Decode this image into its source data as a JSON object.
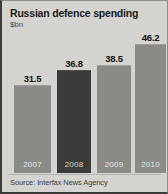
{
  "chart_data": {
    "type": "bar",
    "title": "Russian defence spending",
    "subtitle": "$bn",
    "xlabel": "",
    "ylabel": "$bn",
    "ylim": [
      0,
      46.2
    ],
    "grid": false,
    "legend": null,
    "source": "Source: Interfax News Agency",
    "categories": [
      "2007",
      "2008",
      "2009",
      "2010"
    ],
    "values": [
      31.5,
      38.8,
      38.5,
      46.2
    ],
    "series": [
      {
        "name": "Russian defence spending",
        "values": [
          31.5,
          36.8,
          38.5,
          46.2
        ]
      }
    ],
    "points": [
      {
        "category": "2007",
        "value": 31.5,
        "label": "31.5",
        "highlight": false,
        "color": "#8a8a86"
      },
      {
        "category": "2008",
        "value": 36.8,
        "label": "36.8",
        "highlight": true,
        "color": "#3b3b39"
      },
      {
        "category": "2009",
        "value": 38.5,
        "label": "38.5",
        "highlight": false,
        "color": "#8a8a86"
      },
      {
        "category": "2010",
        "value": 46.2,
        "label": "46.2",
        "highlight": false,
        "color": "#8a8a86"
      }
    ],
    "colors": {
      "bar": "#8a8a86",
      "bar_highlight": "#3b3b39",
      "background": "#d4d3cf",
      "text": "#1b1b1a",
      "category_label": "#e7e6e2"
    }
  }
}
